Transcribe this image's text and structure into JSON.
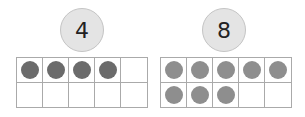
{
  "frames": [
    {
      "number": "4",
      "count": 4,
      "dot_color": "#6b6b6b"
    },
    {
      "number": "8",
      "count": 8,
      "dot_color": "#8e8e8e"
    }
  ],
  "layout": {
    "cells_per_frame": 10,
    "columns": 5,
    "rows": 2
  }
}
